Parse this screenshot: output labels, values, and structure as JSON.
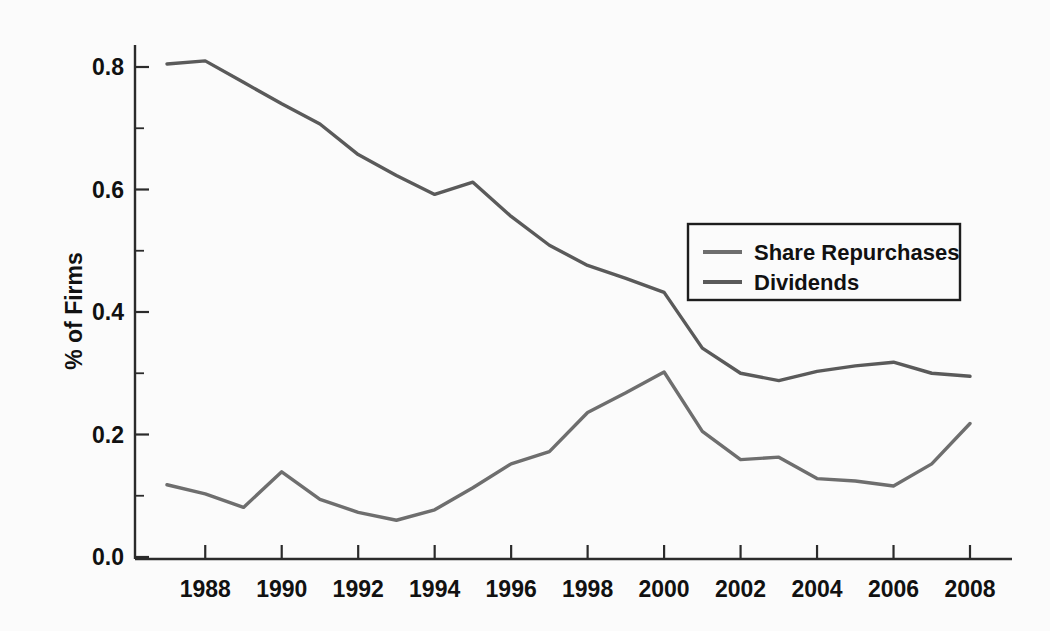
{
  "chart_data": {
    "type": "line",
    "title": "",
    "xlabel": "",
    "ylabel": "% of Firms",
    "xlim": [
      1987,
      2008
    ],
    "ylim": [
      0.0,
      0.86
    ],
    "grid": false,
    "legend_position": "upper right",
    "x": [
      1987,
      1988,
      1989,
      1990,
      1991,
      1992,
      1993,
      1994,
      1995,
      1996,
      1997,
      1998,
      1999,
      2000,
      2001,
      2002,
      2003,
      2004,
      2005,
      2006,
      2007,
      2008
    ],
    "xticks": [
      1988,
      1990,
      1992,
      1994,
      1996,
      1998,
      2000,
      2002,
      2004,
      2006,
      2008
    ],
    "xtick_labels": [
      "1988",
      "1990",
      "1992",
      "1994",
      "1996",
      "1998",
      "2000",
      "2002",
      "2004",
      "2006",
      "2008"
    ],
    "yticks": [
      0.0,
      0.2,
      0.4,
      0.6,
      0.8
    ],
    "ytick_labels": [
      "0.0",
      "0.2",
      "0.4",
      "0.6",
      "0.8"
    ],
    "yticks_minor": [
      0.1,
      0.3,
      0.5,
      0.7
    ],
    "series": [
      {
        "name": "Share Repurchases",
        "color": "#6e6e6e",
        "values": [
          0.118,
          0.103,
          0.081,
          0.139,
          0.094,
          0.073,
          0.06,
          0.077,
          0.113,
          0.152,
          0.172,
          0.236,
          0.268,
          0.302,
          0.205,
          0.159,
          0.163,
          0.128,
          0.124,
          0.116,
          0.152,
          0.218
        ]
      },
      {
        "name": "Dividends",
        "color": "#5a5a5a",
        "values": [
          0.805,
          0.81,
          0.775,
          0.74,
          0.707,
          0.657,
          0.623,
          0.592,
          0.612,
          0.556,
          0.509,
          0.476,
          0.455,
          0.432,
          0.341,
          0.3,
          0.288,
          0.303,
          0.312,
          0.318,
          0.3,
          0.295
        ]
      }
    ]
  },
  "legend": {
    "entries": [
      {
        "label": "Share Repurchases"
      },
      {
        "label": "Dividends"
      }
    ]
  },
  "axes": {
    "y_title": "% of Firms"
  }
}
